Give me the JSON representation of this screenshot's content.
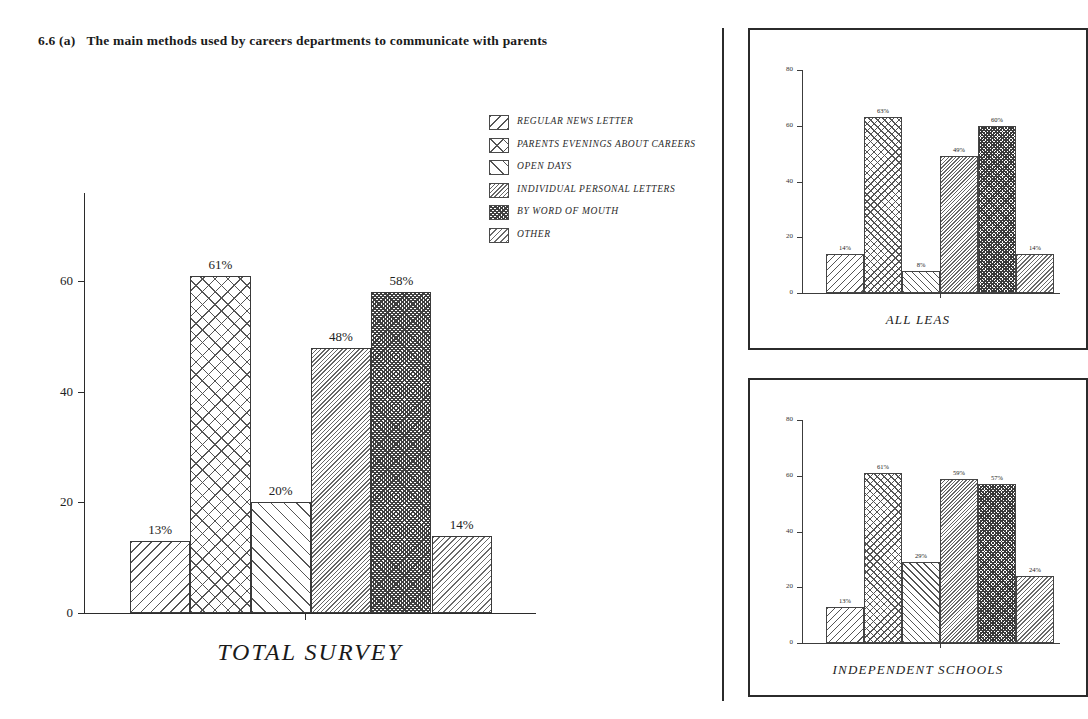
{
  "title": {
    "number": "6.6 (a)",
    "text": "The main methods used by careers departments to communicate with parents"
  },
  "legend": {
    "items": [
      {
        "label": "REGULAR NEWS LETTER",
        "pattern": "diagonal-back-hatch"
      },
      {
        "label": "PARENTS EVENINGS ABOUT CAREERS",
        "pattern": "cross-diamond-hatch"
      },
      {
        "label": "OPEN DAYS",
        "pattern": "diagonal-forward-hatch"
      },
      {
        "label": "INDIVIDUAL PERSONAL LETTERS",
        "pattern": "fine-back-hatch"
      },
      {
        "label": "BY WORD OF MOUTH",
        "pattern": "dense-cross-hatch"
      },
      {
        "label": "OTHER",
        "pattern": "fine-forward-hatch"
      }
    ]
  },
  "chart_data": [
    {
      "type": "bar",
      "name": "total-survey",
      "title": "TOTAL SURVEY",
      "xlabel": "",
      "ylabel": "",
      "ylim": [
        0,
        76
      ],
      "yticks": [
        0,
        20,
        40,
        60
      ],
      "grid": false,
      "legend_position": "top-right",
      "categories": [
        "REGULAR NEWS LETTER",
        "PARENTS EVENINGS ABOUT CAREERS",
        "OPEN DAYS",
        "INDIVIDUAL PERSONAL LETTERS",
        "BY WORD OF MOUTH",
        "OTHER"
      ],
      "values": [
        13,
        61,
        20,
        48,
        58,
        14
      ],
      "data_labels": [
        "13%",
        "61%",
        "20%",
        "48%",
        "58%",
        "14%"
      ]
    },
    {
      "type": "bar",
      "name": "all-leas",
      "title": "ALL LEAS",
      "xlabel": "",
      "ylabel": "",
      "ylim": [
        0,
        80
      ],
      "yticks": [
        0,
        20,
        40,
        60,
        80
      ],
      "grid": false,
      "legend_position": "none",
      "categories": [
        "REGULAR NEWS LETTER",
        "PARENTS EVENINGS ABOUT CAREERS",
        "OPEN DAYS",
        "INDIVIDUAL PERSONAL LETTERS",
        "BY WORD OF MOUTH",
        "OTHER"
      ],
      "values": [
        14,
        63,
        8,
        49,
        60,
        14
      ],
      "data_labels": [
        "14%",
        "63%",
        "8%",
        "49%",
        "60%",
        "14%"
      ]
    },
    {
      "type": "bar",
      "name": "independent-schools",
      "title": "INDEPENDENT SCHOOLS",
      "xlabel": "",
      "ylabel": "",
      "ylim": [
        0,
        80
      ],
      "yticks": [
        0,
        20,
        40,
        60,
        80
      ],
      "grid": false,
      "legend_position": "none",
      "categories": [
        "REGULAR NEWS LETTER",
        "PARENTS EVENINGS ABOUT CAREERS",
        "OPEN DAYS",
        "INDIVIDUAL PERSONAL LETTERS",
        "BY WORD OF MOUTH",
        "OTHER"
      ],
      "values": [
        13,
        61,
        29,
        59,
        57,
        24
      ],
      "data_labels": [
        "13%",
        "61%",
        "29%",
        "59%",
        "57%",
        "24%"
      ]
    }
  ],
  "main_chart": {
    "caption": "TOTAL SURVEY",
    "ytick_labels": [
      "0",
      "20",
      "40",
      "60"
    ],
    "bar_labels": [
      "13%",
      "61%",
      "20%",
      "48%",
      "58%",
      "14%"
    ]
  },
  "panels": [
    {
      "caption": "ALL LEAS",
      "ytick_labels": [
        "0",
        "20",
        "40",
        "60",
        "80"
      ],
      "bar_labels": [
        "14%",
        "63%",
        "8%",
        "49%",
        "60%",
        "14%"
      ]
    },
    {
      "caption": "INDEPENDENT SCHOOLS",
      "ytick_labels": [
        "0",
        "20",
        "40",
        "60",
        "80"
      ],
      "bar_labels": [
        "13%",
        "61%",
        "29%",
        "59%",
        "57%",
        "24%"
      ]
    }
  ],
  "colors": {
    "ink": "#1a1a1a",
    "axis": "#2b2b2b",
    "hatch": "#555555",
    "background": "#ffffff"
  }
}
